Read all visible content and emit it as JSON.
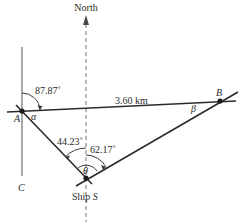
{
  "diagram": {
    "north_label": "North",
    "distance_label": "3.60 km",
    "point_a": "A",
    "point_b": "B",
    "point_c": "C",
    "ship_label": "Ship",
    "ship_point": "S",
    "angle_north_ab": "87.87˚",
    "angle_alpha": "α",
    "angle_beta": "β",
    "angle_theta": "θ",
    "angle_as_north": "44.23˚",
    "angle_north_sb": "62.17˚",
    "colors": {
      "line": "#2b2b2b",
      "guide": "#7a7a7a",
      "text": "#2a2a2a"
    }
  }
}
